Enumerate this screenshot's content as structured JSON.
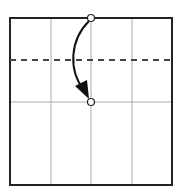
{
  "diagram": {
    "type": "origami-fold-step",
    "square": {
      "x": 10,
      "y": 18,
      "w": 162,
      "h": 167,
      "stroke": "#222222"
    },
    "grid": {
      "vertical_x": [
        51,
        91,
        132
      ],
      "horizontal_y": [
        102
      ],
      "stroke": "#aaaaaa"
    },
    "fold_line": {
      "type": "valley-fold",
      "y": 60,
      "stroke": "#444444"
    },
    "reference_points": [
      {
        "name": "top-point",
        "x": 91,
        "y": 18
      },
      {
        "name": "target-point",
        "x": 91,
        "y": 102
      }
    ],
    "arrow": {
      "from": "top-point",
      "to": "target-point",
      "color": "#111111"
    }
  }
}
